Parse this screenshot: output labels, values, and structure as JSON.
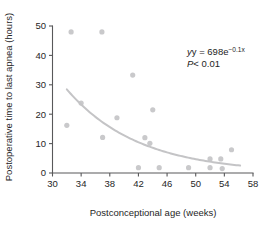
{
  "chart_data": {
    "type": "scatter",
    "title": "",
    "xlabel": "Postconceptional age (weeks)",
    "ylabel": "Postoperative time to last apnea (hours)",
    "xlim": [
      30,
      58
    ],
    "ylim": [
      0,
      50
    ],
    "xticks": [
      30,
      34,
      38,
      42,
      46,
      50,
      54,
      58
    ],
    "yticks": [
      0,
      10,
      20,
      30,
      40,
      50
    ],
    "grid": false,
    "legend": "none",
    "point_color": "#c9c9cb",
    "curve_color": "#c4c4c6",
    "axis_color": "#58585a",
    "points": [
      {
        "x": 32.0,
        "y": 16.2
      },
      {
        "x": 32.6,
        "y": 48.0
      },
      {
        "x": 34.0,
        "y": 23.8
      },
      {
        "x": 36.9,
        "y": 48.0
      },
      {
        "x": 37.0,
        "y": 12.1
      },
      {
        "x": 39.0,
        "y": 18.8
      },
      {
        "x": 41.2,
        "y": 33.3
      },
      {
        "x": 42.0,
        "y": 1.8
      },
      {
        "x": 42.9,
        "y": 12.0
      },
      {
        "x": 43.6,
        "y": 10.1
      },
      {
        "x": 44.0,
        "y": 21.5
      },
      {
        "x": 44.9,
        "y": 1.8
      },
      {
        "x": 49.0,
        "y": 1.8
      },
      {
        "x": 52.0,
        "y": 4.8
      },
      {
        "x": 52.0,
        "y": 1.8
      },
      {
        "x": 53.5,
        "y": 4.8
      },
      {
        "x": 53.7,
        "y": 1.5
      },
      {
        "x": 55.0,
        "y": 7.9
      }
    ],
    "fit": {
      "equation_text": "y = 698e",
      "equation_exponent": "−0.1x",
      "p_value_symbol": "P",
      "p_value_text": "< 0.01",
      "model": "exponential",
      "coefficient": 698,
      "rate": -0.1,
      "x_start": 32.0,
      "x_end": 56.2
    }
  }
}
